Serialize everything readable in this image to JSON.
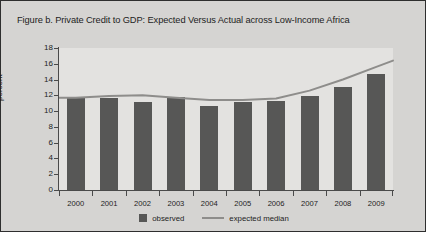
{
  "figure": {
    "title": "Figure b. Private Credit to GDP: Expected Versus Actual across Low-Income Africa",
    "panel_bg": "#d5d4d2",
    "plot_bg": "#e3e2e0",
    "bar_color": "#575756",
    "line_color": "#8e8d8b",
    "axis_color": "#4a4a4a"
  },
  "legend": {
    "position": "bottom-center",
    "items": [
      {
        "label": "observed",
        "marker": "square-swatch",
        "color": "#575756"
      },
      {
        "label": "expected median",
        "marker": "line-swatch",
        "color": "#8e8d8b"
      }
    ]
  },
  "chart_data": {
    "type": "bar",
    "title": "Figure b. Private Credit to GDP: Expected Versus Actual across Low-Income Africa",
    "xlabel": "",
    "ylabel": "percent",
    "categories": [
      "2000",
      "2001",
      "2002",
      "2003",
      "2004",
      "2005",
      "2006",
      "2007",
      "2008",
      "2009"
    ],
    "ylim": [
      0,
      18
    ],
    "yticks": [
      0,
      2,
      4,
      6,
      8,
      10,
      12,
      14,
      16,
      18
    ],
    "ytick_labels": [
      "0",
      "2",
      "4",
      "6",
      "8",
      "10",
      "12",
      "14",
      "16",
      "18"
    ],
    "grid": false,
    "legend_position": "bottom-center",
    "series": [
      {
        "name": "observed",
        "type": "bar",
        "color": "#575756",
        "values": [
          11.7,
          11.7,
          11.2,
          11.8,
          10.7,
          11.1,
          11.3,
          11.9,
          13.1,
          14.7
        ]
      },
      {
        "name": "expected median",
        "type": "line",
        "color": "#8e8d8b",
        "values": [
          11.7,
          11.9,
          12.0,
          11.7,
          11.4,
          11.4,
          11.6,
          12.6,
          14.0,
          15.6
        ]
      }
    ]
  }
}
